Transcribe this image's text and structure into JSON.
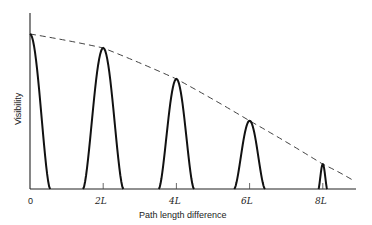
{
  "chart_data": {
    "type": "line",
    "title": "",
    "xlabel": "Path length difference",
    "ylabel": "Visibility",
    "x_ticks": [
      "0",
      "2L",
      "4L",
      "6L",
      "8L"
    ],
    "x_tick_values": [
      0,
      2,
      4,
      6,
      8
    ],
    "xlim": [
      0,
      9
    ],
    "ylim": [
      0,
      1
    ],
    "grid": false,
    "legend": null,
    "series": [
      {
        "name": "visibility peaks",
        "style": "solid",
        "peaks": [
          {
            "x": 0,
            "height": 1.0,
            "half_width": 0.55
          },
          {
            "x": 2,
            "height": 0.91,
            "half_width": 0.55
          },
          {
            "x": 4,
            "height": 0.71,
            "half_width": 0.48
          },
          {
            "x": 6,
            "height": 0.44,
            "half_width": 0.42
          },
          {
            "x": 8,
            "height": 0.16,
            "half_width": 0.12
          }
        ]
      },
      {
        "name": "envelope",
        "style": "dashed",
        "x": [
          0,
          2,
          4,
          6,
          8,
          8.8
        ],
        "values": [
          1.0,
          0.91,
          0.71,
          0.44,
          0.16,
          0.06
        ]
      }
    ]
  },
  "labels": {
    "x_axis": "Path length difference",
    "y_axis": "Visibility",
    "ticks": [
      "0",
      "2L",
      "4L",
      "6L",
      "8L"
    ]
  }
}
